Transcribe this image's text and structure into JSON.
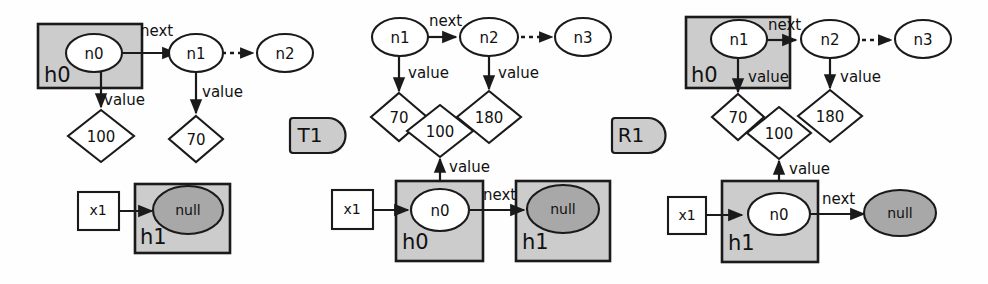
{
  "diagram": {
    "colors": {
      "background": "#fefefe",
      "stroke": "#1a1a1a",
      "heap_fill": "#cccccc",
      "null_fill": "#a8a8a8",
      "node_fill": "#ffffff",
      "badge_fill": "#cccccc"
    },
    "edge_labels": {
      "next": "next",
      "value": "value"
    },
    "panels": [
      {
        "id": "panel-left",
        "badge": "T1",
        "nodes": [
          {
            "id": "n0",
            "label": "n0"
          },
          {
            "id": "n1",
            "label": "n1"
          },
          {
            "id": "n2",
            "label": "n2"
          }
        ],
        "values": [
          {
            "id": "v100",
            "label": "100"
          },
          {
            "id": "v70",
            "label": "70"
          }
        ],
        "heaps": [
          {
            "id": "h0",
            "label": "h0"
          },
          {
            "id": "h1",
            "label": "h1"
          }
        ],
        "variables": [
          {
            "id": "x1",
            "label": "x1"
          }
        ],
        "null_label": "null"
      },
      {
        "id": "panel-middle",
        "badge": "R1",
        "nodes": [
          {
            "id": "n1",
            "label": "n1"
          },
          {
            "id": "n2",
            "label": "n2"
          },
          {
            "id": "n3",
            "label": "n3"
          },
          {
            "id": "n0",
            "label": "n0"
          }
        ],
        "values": [
          {
            "id": "v70",
            "label": "70"
          },
          {
            "id": "v100",
            "label": "100"
          },
          {
            "id": "v180",
            "label": "180"
          }
        ],
        "heaps": [
          {
            "id": "h0",
            "label": "h0"
          },
          {
            "id": "h1",
            "label": "h1"
          }
        ],
        "variables": [
          {
            "id": "x1",
            "label": "x1"
          }
        ],
        "null_label": "null"
      },
      {
        "id": "panel-right",
        "badge": "",
        "nodes": [
          {
            "id": "n1",
            "label": "n1"
          },
          {
            "id": "n2",
            "label": "n2"
          },
          {
            "id": "n3",
            "label": "n3"
          },
          {
            "id": "n0",
            "label": "n0"
          }
        ],
        "values": [
          {
            "id": "v70",
            "label": "70"
          },
          {
            "id": "v100",
            "label": "100"
          },
          {
            "id": "v180",
            "label": "180"
          }
        ],
        "heaps": [
          {
            "id": "h0",
            "label": "h0"
          },
          {
            "id": "h1",
            "label": "h1"
          }
        ],
        "variables": [
          {
            "id": "x1",
            "label": "x1"
          }
        ],
        "null_label": "null"
      }
    ]
  }
}
